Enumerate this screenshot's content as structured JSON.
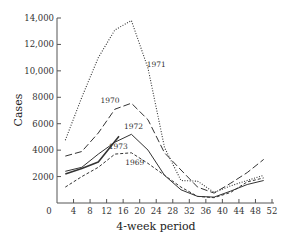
{
  "chart_data": {
    "type": "line",
    "title": "",
    "xlabel": "4-week period",
    "ylabel": "Cases",
    "xlim": [
      0,
      52
    ],
    "ylim": [
      0,
      14000
    ],
    "x_ticks": [
      0,
      4,
      8,
      12,
      16,
      20,
      24,
      28,
      32,
      36,
      40,
      44,
      48,
      52
    ],
    "x_tick_labels": [
      "0",
      "4",
      "8",
      "12",
      "16",
      "20",
      "24",
      "28",
      "32",
      "36",
      "40",
      "44",
      "48",
      "52"
    ],
    "y_ticks": [
      2000,
      4000,
      6000,
      8000,
      10000,
      12000,
      14000
    ],
    "y_tick_labels": [
      "2000",
      "4000",
      "6000",
      "8000",
      "10,000",
      "12,000",
      "14,000"
    ],
    "grid": false,
    "legend": "inline labels",
    "series": [
      {
        "name": "1971",
        "style": "dotted",
        "x": [
          2,
          6,
          10,
          14,
          18,
          22,
          26,
          30,
          34,
          38,
          42,
          46,
          50
        ],
        "values": [
          4750,
          8000,
          11000,
          13100,
          13800,
          10200,
          4200,
          1700,
          1650,
          800,
          1300,
          1700,
          2100
        ],
        "label_pos": [
          24,
          10300
        ]
      },
      {
        "name": "1970",
        "style": "long-dash",
        "x": [
          2,
          6,
          10,
          14,
          18,
          22,
          26,
          30,
          34,
          38,
          42,
          46,
          50
        ],
        "values": [
          3550,
          3900,
          5300,
          7100,
          7550,
          6300,
          3800,
          2500,
          1200,
          750,
          1500,
          2300,
          3300
        ],
        "label_pos": [
          12.8,
          7600
        ]
      },
      {
        "name": "1972",
        "style": "solid",
        "x": [
          2,
          6,
          10,
          14,
          18,
          22,
          26,
          30,
          34,
          38,
          42,
          46,
          50
        ],
        "values": [
          2400,
          2700,
          3700,
          4600,
          5200,
          4000,
          2100,
          1000,
          500,
          450,
          900,
          1400,
          1700
        ],
        "label_pos": [
          18.5,
          5600
        ]
      },
      {
        "name": "1973",
        "style": "solid-thick",
        "x": [
          2,
          6,
          10,
          15
        ],
        "values": [
          2200,
          2600,
          3100,
          5050
        ],
        "label_pos": [
          14.8,
          4100
        ]
      },
      {
        "name": "1969",
        "style": "short-dash",
        "x": [
          2,
          6,
          10,
          14,
          18,
          22,
          26,
          30,
          34,
          38,
          42,
          46,
          50
        ],
        "values": [
          1200,
          2000,
          2700,
          3700,
          3800,
          3000,
          2100,
          1200,
          500,
          400,
          800,
          1600,
          1900
        ],
        "label_pos": [
          18.8,
          2900
        ]
      }
    ]
  }
}
